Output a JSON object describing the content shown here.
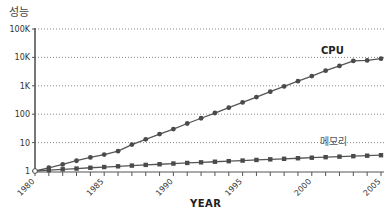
{
  "chart_data": {
    "type": "line",
    "title": "",
    "xlabel": "YEAR",
    "ylabel": "성능",
    "yscale": "log",
    "ylim": [
      1,
      100000
    ],
    "xlim": [
      1980,
      2005
    ],
    "y_ticks": [
      {
        "value": 1,
        "label": "1"
      },
      {
        "value": 10,
        "label": "10"
      },
      {
        "value": 100,
        "label": "100"
      },
      {
        "value": 1000,
        "label": "1K"
      },
      {
        "value": 10000,
        "label": "10K"
      },
      {
        "value": 100000,
        "label": "100K"
      }
    ],
    "x_ticks": [
      {
        "value": 1980,
        "label": "1980"
      },
      {
        "value": 1985,
        "label": "1985"
      },
      {
        "value": 1990,
        "label": "1990"
      },
      {
        "value": 1995,
        "label": "1995"
      },
      {
        "value": 2000,
        "label": "2000"
      },
      {
        "value": 2005,
        "label": "2005"
      }
    ],
    "grid": {
      "horizontal": true,
      "style": "dotted"
    },
    "legend": "inline labels",
    "x": [
      1980,
      1981,
      1982,
      1983,
      1984,
      1985,
      1986,
      1987,
      1988,
      1989,
      1990,
      1991,
      1992,
      1993,
      1994,
      1995,
      1996,
      1997,
      1998,
      1999,
      2000,
      2001,
      2002,
      2003,
      2004,
      2005
    ],
    "series": [
      {
        "name": "CPU",
        "marker": "circle",
        "values": [
          1,
          1.3,
          1.7,
          2.3,
          3,
          3.8,
          5,
          8.5,
          13,
          20,
          30,
          47,
          72,
          110,
          170,
          260,
          400,
          620,
          950,
          1450,
          2200,
          3400,
          5000,
          7500,
          7800,
          9000
        ]
      },
      {
        "name": "메모리",
        "marker": "square",
        "values": [
          1,
          1.07,
          1.15,
          1.22,
          1.3,
          1.38,
          1.46,
          1.55,
          1.64,
          1.73,
          1.83,
          1.92,
          2.02,
          2.12,
          2.22,
          2.33,
          2.45,
          2.57,
          2.69,
          2.81,
          2.94,
          3.07,
          3.2,
          3.33,
          3.46,
          3.6
        ]
      }
    ]
  },
  "labels": {
    "ylabel": "성능",
    "xlabel": "YEAR",
    "cpu": "CPU",
    "memory": "메모리"
  },
  "colors": {
    "line": "#555555",
    "marker": "#4a4a4a",
    "axis": "#555555",
    "grid": "#888888",
    "text": "#333333"
  }
}
